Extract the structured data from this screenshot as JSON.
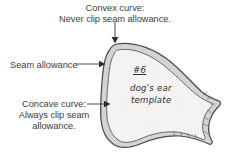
{
  "diagram": {
    "type": "sewing-pattern-template",
    "background_color": "#ffffff",
    "outline_color": "#4a4a4a",
    "seam_band_color": "#d9d9d9",
    "interior_color": "#f2f2f0",
    "text_color": "#3d3d3d"
  },
  "labels": {
    "convex": "Convex curve:\nNever clip seam allowance.",
    "seam": "Seam allowance",
    "concave": "Concave curve:\nAlways clip seam\nallowance."
  },
  "annotations": {
    "number": "#6",
    "name": "dog's ear",
    "kind": "template"
  },
  "leaders": [
    {
      "name": "convex-leader",
      "from": [
        115,
        22
      ],
      "to": [
        115,
        43
      ],
      "arrow": "down"
    },
    {
      "name": "seam-leader",
      "from": [
        76,
        64
      ],
      "to": [
        104,
        64
      ],
      "arrow": "right"
    },
    {
      "name": "concave-leader",
      "from": [
        87,
        104
      ],
      "to": [
        109,
        104
      ],
      "arrow": "right"
    }
  ]
}
